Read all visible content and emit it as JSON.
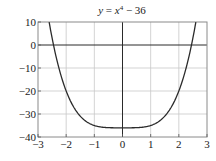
{
  "chart_data": {
    "type": "line",
    "title_parts": {
      "lhs": "y",
      "eq": " = ",
      "var": "x",
      "exp": "4",
      "rest": " − 36"
    },
    "function": "x^4 - 36",
    "xlabel": "",
    "ylabel": "",
    "xlim": [
      -3,
      3
    ],
    "ylim": [
      -40,
      10
    ],
    "x_ticks": [
      -3,
      -2,
      -1,
      0,
      1,
      2,
      3
    ],
    "x_tick_labels": [
      "−3",
      "−2",
      "−1",
      "0",
      "1",
      "2",
      "3"
    ],
    "y_ticks": [
      10,
      0,
      -10,
      -20,
      -30,
      -40
    ],
    "y_tick_labels": [
      "10",
      "0",
      "−10",
      "−20",
      "−30",
      "−40"
    ],
    "grid": true,
    "legend": null,
    "series": [
      {
        "name": "y = x^4 - 36",
        "x": [
          -2.604,
          -2.5,
          -2.449,
          -2.25,
          -2.0,
          -1.75,
          -1.5,
          -1.25,
          -1.0,
          -0.75,
          -0.5,
          -0.25,
          0,
          0.25,
          0.5,
          0.75,
          1.0,
          1.25,
          1.5,
          1.75,
          2.0,
          2.25,
          2.449,
          2.5,
          2.604
        ],
        "y": [
          10,
          3.06,
          0,
          -10.37,
          -20,
          -26.62,
          -30.94,
          -33.56,
          -35,
          -35.68,
          -35.94,
          -36.0,
          -36,
          -36.0,
          -35.94,
          -35.68,
          -35,
          -33.56,
          -30.94,
          -26.62,
          -20,
          -10.37,
          0,
          3.06,
          10
        ]
      }
    ],
    "annotations": {
      "roots": [
        -2.449,
        2.449
      ],
      "minimum": {
        "x": 0,
        "y": -36
      }
    },
    "colors": {
      "curve": "#2b2b2b",
      "axes": "#2a2a2a",
      "grid": "#c8c8c8",
      "frame": "#8a8a8a"
    }
  }
}
